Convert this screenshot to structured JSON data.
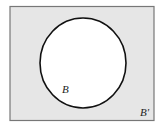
{
  "diagram": {
    "type": "venn",
    "universe": {
      "shaded": true,
      "fill": "#e6e6e6",
      "stroke": "#777777"
    },
    "set": {
      "label": "B",
      "fill": "#ffffff",
      "stroke": "#111111"
    },
    "complement_label": "B'"
  }
}
